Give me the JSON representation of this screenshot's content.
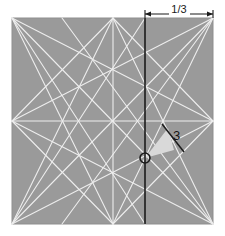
{
  "figure": {
    "background_color": "#ffffff",
    "square": {
      "fill_color": "#9a9a9a",
      "stroke_color": "#8a8a8a",
      "x": 12,
      "y": 18,
      "width": 201,
      "height": 206
    },
    "construction_lines": {
      "color": "#e8e8e8",
      "width": 1.1,
      "description": "white construction lines joining square corners and edge midpoints"
    },
    "division_line": {
      "label": "vertical third line",
      "color": "#1b1b1b",
      "width": 1.6,
      "x": 145,
      "y_top": 18,
      "y_bottom": 224
    },
    "dimension": {
      "label": "1/3",
      "y": 14,
      "x_start": 145,
      "x_end": 213,
      "color": "#1a1a1a"
    },
    "shaded_wedge": {
      "fill_color": "#d9d9d9",
      "apex": {
        "x": 145,
        "y": 158
      },
      "points": "145,158 168,128 174,150"
    },
    "length_label": {
      "text": "3",
      "x": 173,
      "y": 140,
      "color": "#141414"
    },
    "cut_segment": {
      "color": "#1b1b1b",
      "width": 1.5,
      "x1": 162,
      "y1": 124,
      "x2": 184,
      "y2": 152
    },
    "origin_marker": {
      "label": "O",
      "cx": 145,
      "cy": 158,
      "r": 5,
      "color": "#1b1b1b"
    }
  }
}
